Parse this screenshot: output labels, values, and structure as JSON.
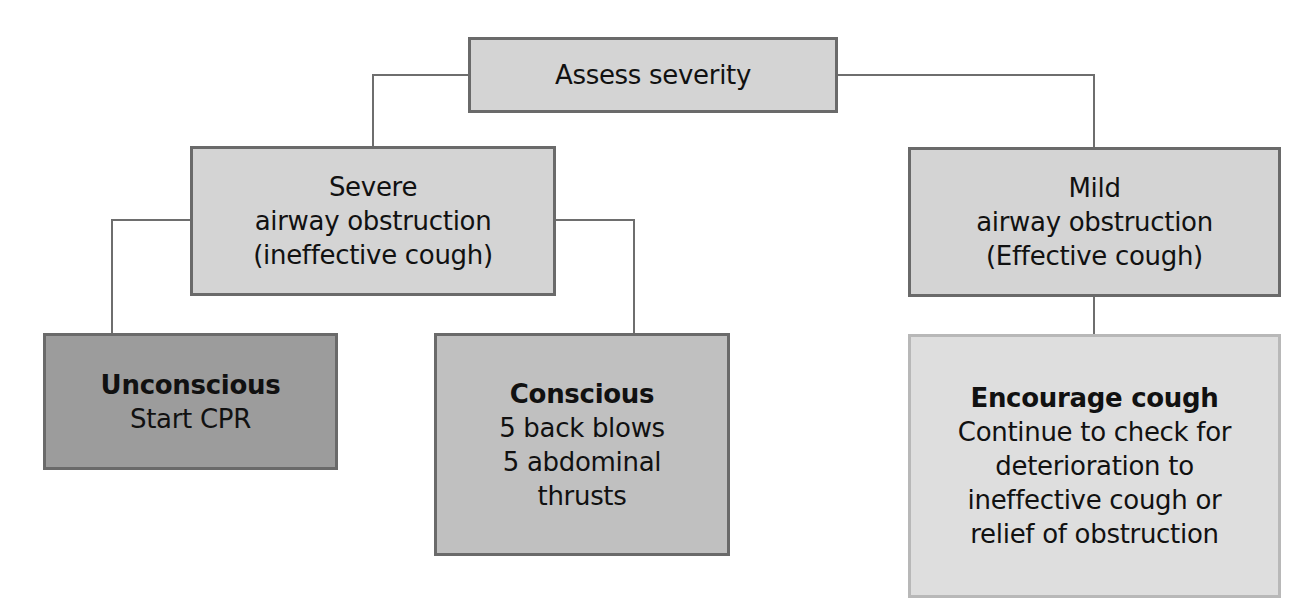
{
  "diagram": {
    "type": "flowchart",
    "topic": "Choking / airway obstruction management",
    "colors": {
      "standard_fill": "#d4d4d4",
      "unconscious_fill": "#9c9c9c",
      "conscious_fill": "#c0c0c0",
      "encourage_fill": "#dedede",
      "border": "#6a6a6a",
      "encourage_border": "#b8b8b8",
      "connector": "#6e6e6e"
    },
    "nodes": {
      "assess": {
        "lines": [
          "Assess severity"
        ]
      },
      "severe": {
        "title": "Severe",
        "lines": [
          "airway obstruction",
          "(ineffective cough)"
        ]
      },
      "mild": {
        "title": "Mild",
        "lines": [
          "airway obstruction",
          "(Effective cough)"
        ]
      },
      "unconscious": {
        "title": "Unconscious",
        "lines": [
          "Start CPR"
        ]
      },
      "conscious": {
        "title": "Conscious",
        "lines": [
          "5 back blows",
          "5 abdominal",
          "thrusts"
        ]
      },
      "encourage": {
        "title": "Encourage cough",
        "lines": [
          "Continue to check for",
          "deterioration to",
          "ineffective cough or",
          "relief of obstruction"
        ]
      }
    },
    "edges": [
      [
        "assess",
        "severe"
      ],
      [
        "assess",
        "mild"
      ],
      [
        "severe",
        "unconscious"
      ],
      [
        "severe",
        "conscious"
      ],
      [
        "mild",
        "encourage"
      ]
    ]
  }
}
